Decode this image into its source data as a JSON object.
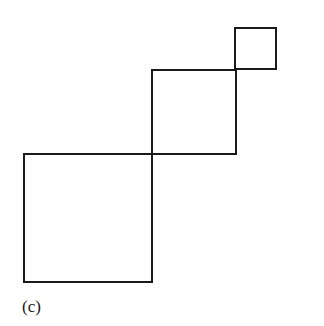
{
  "figure": {
    "label": "(c)",
    "stroke_color": "#1a1a1a",
    "background": "#ffffff",
    "squares": [
      {
        "name": "large-square",
        "x": 24,
        "y": 154,
        "size": 128
      },
      {
        "name": "medium-square",
        "x": 152,
        "y": 70,
        "size": 84
      },
      {
        "name": "small-square",
        "x": 235,
        "y": 28,
        "size": 41
      }
    ]
  }
}
